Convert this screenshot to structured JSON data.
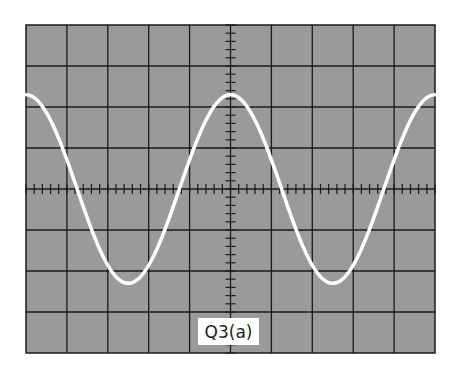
{
  "figure": {
    "label": "Q3(a)",
    "screen_color": "#9a9a9a",
    "grid_color": "#1a1a1a",
    "trace_color": "#ffffff",
    "divisions": {
      "horizontal": 10,
      "vertical": 8
    },
    "minor_ticks_per_division": 5
  },
  "chart_data": {
    "type": "line",
    "title": "Q3(a)",
    "xlabel": "",
    "ylabel": "",
    "x_unit": "divisions",
    "y_unit": "divisions",
    "xlim": [
      -5,
      5
    ],
    "ylim": [
      -4,
      4
    ],
    "grid": true,
    "waveform": "cosine",
    "amplitude_div": 2.3,
    "period_div": 5,
    "phase": "peak at center (x=0)",
    "x": [
      -5,
      -3.75,
      -2.5,
      -1.25,
      0,
      1.25,
      2.5,
      3.75,
      5
    ],
    "y": [
      2.3,
      0,
      -2.3,
      0,
      2.3,
      0,
      -2.3,
      0,
      2.3
    ]
  }
}
